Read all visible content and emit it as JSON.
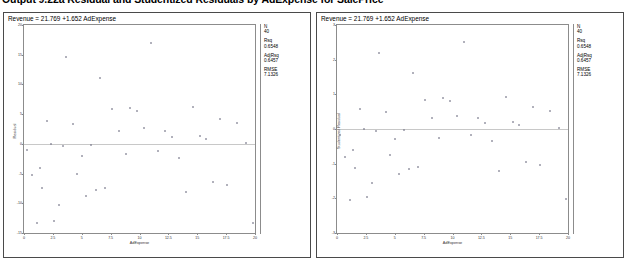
{
  "header": {
    "title": "Output 9.22a Residual and Studentized Residuals by AdExpense for SalePrice"
  },
  "panels": [
    {
      "id": "left",
      "equation": "Revenue = 21.769 +1.652 AdExpense",
      "stats": [
        {
          "label": "N",
          "value": "40"
        },
        {
          "label": "Rsq",
          "value": "0.6548"
        },
        {
          "label": "AdjRsq",
          "value": "0.6457"
        },
        {
          "label": "RMSE",
          "value": "7.1326"
        }
      ]
    },
    {
      "id": "right",
      "equation": "Revenue = 21.769 +1.652 AdExpense",
      "stats": [
        {
          "label": "N",
          "value": "40"
        },
        {
          "label": "Rsq",
          "value": "0.6548"
        },
        {
          "label": "AdjRsq",
          "value": "0.6457"
        },
        {
          "label": "RMSE",
          "value": "7.1326"
        }
      ]
    }
  ],
  "chart_data": [
    {
      "type": "scatter",
      "id": "residual-plot",
      "title": "Revenue = 21.769 +1.652 AdExpense",
      "xlabel": "AdExpense",
      "ylabel": "Residual",
      "xlim": [
        0,
        20
      ],
      "ylim": [
        -15,
        20
      ],
      "xticks": [
        0,
        2.5,
        5,
        7.5,
        10,
        12.5,
        15,
        17.5,
        20
      ],
      "xticklabels": [
        "0",
        "2.5",
        "5",
        "7.5",
        "10",
        "12.5",
        "15",
        "17.5",
        "20"
      ],
      "yticks": [
        -15,
        -10,
        -5,
        0,
        5,
        10,
        15,
        20
      ],
      "yticklabels": [
        "-15",
        "-10",
        "-5",
        "0",
        "5",
        "10",
        "15",
        "20"
      ],
      "grid": false,
      "reference_line": {
        "y": 0,
        "color": "#c8c8c8"
      },
      "marker": "open-circle",
      "marker_color": "#7a7a8c",
      "x": [
        0.3,
        0.7,
        1.1,
        1.4,
        1.6,
        2.0,
        2.3,
        2.6,
        3.0,
        3.4,
        3.6,
        4.2,
        4.6,
        5.0,
        5.4,
        5.8,
        6.2,
        6.6,
        7.0,
        7.6,
        8.2,
        8.8,
        9.2,
        9.8,
        10.4,
        11.0,
        11.6,
        12.2,
        12.8,
        13.4,
        14.0,
        14.6,
        15.2,
        15.8,
        16.4,
        17.0,
        17.6,
        18.4,
        19.2,
        19.8
      ],
      "y": [
        -1.1,
        -5.2,
        -13.4,
        -4.0,
        -7.4,
        3.9,
        0.0,
        -12.9,
        -10.3,
        -0.3,
        14.6,
        3.4,
        -5.0,
        -2.0,
        -8.8,
        -0.2,
        -7.8,
        11.0,
        -7.4,
        5.8,
        2.2,
        -1.7,
        6.0,
        5.6,
        2.6,
        16.9,
        -1.2,
        2.1,
        1.1,
        -2.3,
        -8.1,
        6.2,
        1.3,
        0.8,
        -6.4,
        4.2,
        -7.0,
        3.5,
        0.1,
        -13.3
      ]
    },
    {
      "type": "scatter",
      "id": "studentized-residual-plot",
      "title": "Revenue = 21.769 +1.652 AdExpense",
      "xlabel": "AdExpense",
      "ylabel": "Studentized Residual",
      "xlim": [
        0,
        20
      ],
      "ylim": [
        -3,
        3
      ],
      "xticks": [
        0,
        2.5,
        5,
        7.5,
        10,
        12.5,
        15,
        17.5,
        20
      ],
      "xticklabels": [
        "0",
        "2.5",
        "5",
        "7.5",
        "10",
        "12.5",
        "15",
        "17.5",
        "20"
      ],
      "yticks": [
        -3,
        -2,
        -1,
        0,
        1,
        2,
        3
      ],
      "yticklabels": [
        "-3",
        "-2",
        "-1",
        "0",
        "1",
        "2",
        "3"
      ],
      "grid": false,
      "reference_line": {
        "y": 0,
        "color": "#c8c8c8"
      },
      "marker": "open-circle",
      "marker_color": "#7a7a8c",
      "x": [
        0.3,
        0.7,
        1.1,
        1.4,
        1.6,
        2.0,
        2.3,
        2.6,
        3.0,
        3.4,
        3.6,
        4.2,
        4.6,
        5.0,
        5.4,
        5.8,
        6.2,
        6.6,
        7.0,
        7.6,
        8.2,
        8.8,
        9.2,
        9.8,
        10.4,
        11.0,
        11.6,
        12.2,
        12.8,
        13.4,
        14.0,
        14.6,
        15.2,
        15.8,
        16.4,
        17.0,
        17.6,
        18.4,
        19.2,
        19.8
      ],
      "y": [
        -0.18,
        -0.8,
        -2.05,
        -0.61,
        -1.13,
        0.58,
        0.0,
        -1.95,
        -1.55,
        -0.05,
        2.18,
        0.5,
        -0.74,
        -0.3,
        -1.3,
        -0.03,
        -1.15,
        1.62,
        -1.09,
        0.85,
        0.32,
        -0.25,
        0.88,
        0.82,
        0.38,
        2.5,
        -0.18,
        0.31,
        0.16,
        -0.34,
        -1.2,
        0.92,
        0.19,
        0.12,
        -0.95,
        0.63,
        -1.04,
        0.52,
        0.02,
        -2.02
      ]
    }
  ]
}
